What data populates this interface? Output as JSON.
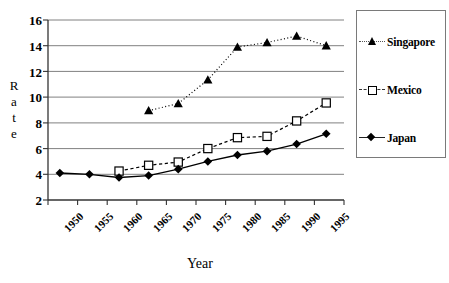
{
  "chart_data": {
    "type": "line",
    "title": "",
    "xlabel": "Year",
    "ylabel": "Rate",
    "xlim": [
      1950,
      2000
    ],
    "ylim": [
      2,
      16
    ],
    "ytick_step": 2,
    "grid": "horizontal",
    "legend_position": "right",
    "x_ticks": [
      "1950",
      "1955",
      "1960",
      "1965",
      "1970",
      "1975",
      "1980",
      "1985",
      "1990",
      "1995"
    ],
    "y_ticks": [
      "2",
      "4",
      "6",
      "8",
      "10",
      "12",
      "14",
      "16"
    ],
    "series": [
      {
        "name": "Singapore",
        "marker": "filled-triangle",
        "line": "dotted",
        "color": "#000000",
        "x": [
          1967,
          1972,
          1977,
          1982,
          1987,
          1992,
          1997
        ],
        "values": [
          8.95,
          9.5,
          11.35,
          13.9,
          14.25,
          14.75,
          14.0
        ]
      },
      {
        "name": "Mexico",
        "marker": "open-square",
        "line": "dashed",
        "color": "#000000",
        "x": [
          1962,
          1967,
          1972,
          1977,
          1982,
          1987,
          1992,
          1997
        ],
        "values": [
          4.25,
          4.7,
          4.95,
          6.0,
          6.85,
          6.95,
          8.15,
          9.55
        ]
      },
      {
        "name": "Japan",
        "marker": "filled-diamond",
        "line": "solid",
        "color": "#000000",
        "x": [
          1952,
          1957,
          1962,
          1967,
          1972,
          1977,
          1982,
          1987,
          1992,
          1997
        ],
        "values": [
          4.1,
          4.0,
          3.75,
          3.9,
          4.4,
          5.0,
          5.5,
          5.8,
          6.35,
          7.15
        ]
      }
    ]
  },
  "axes": {
    "y_label_letters": [
      "R",
      "a",
      "t",
      "e"
    ],
    "x_title": "Year"
  },
  "legend": {
    "entries": [
      {
        "label": "Singapore"
      },
      {
        "label": "Mexico"
      },
      {
        "label": "Japan"
      }
    ]
  },
  "colors": {
    "axis": "#000000",
    "gridline": "#808080",
    "legend_border": "#7a7a7a",
    "plot_background": "#ffffff"
  }
}
